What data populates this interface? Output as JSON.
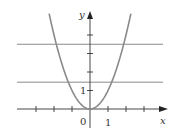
{
  "chart_data": {
    "type": "line",
    "title": "",
    "xlabel": "x",
    "ylabel": "y",
    "x_tick_labels": [
      {
        "value": 0,
        "label": "0"
      },
      {
        "value": 1,
        "label": "1"
      }
    ],
    "y_tick_labels": [
      {
        "value": 1,
        "label": "1"
      }
    ],
    "x_ticks": [
      -3,
      -2,
      -1,
      1,
      2,
      3
    ],
    "y_ticks": [
      1,
      2,
      3,
      4
    ],
    "xlim": [
      -3.9,
      4.3
    ],
    "ylim": [
      -1.2,
      5.3
    ],
    "grid": false,
    "legend": null,
    "series": [
      {
        "name": "y = x^2",
        "kind": "curve",
        "function": "x^2",
        "x_range": [
          -2.27,
          2.27
        ],
        "color": "#8a8a8a",
        "x": [
          -2.25,
          -2,
          -1.5,
          -1.2,
          -1,
          -0.5,
          0,
          0.5,
          1,
          1.2,
          1.5,
          2,
          2.25
        ],
        "values": [
          5.06,
          4,
          2.25,
          1.44,
          1,
          0.25,
          0,
          0.25,
          1,
          1.44,
          2.25,
          4,
          5.06
        ]
      },
      {
        "name": "horizontal line upper",
        "kind": "hline",
        "y": 3.5,
        "x_range": [
          -3.9,
          4.0
        ],
        "color": "#8a8a8a"
      },
      {
        "name": "horizontal line lower",
        "kind": "hline",
        "y": 1.45,
        "x_range": [
          -3.9,
          4.0
        ],
        "color": "#8a8a8a"
      }
    ],
    "colors": {
      "axis": "#333333",
      "curve": "#8a8a8a",
      "hline": "#8a8a8a"
    }
  },
  "labels": {
    "x_axis": "x",
    "y_axis": "y",
    "origin": "0",
    "x_one": "1",
    "y_one": "1"
  }
}
